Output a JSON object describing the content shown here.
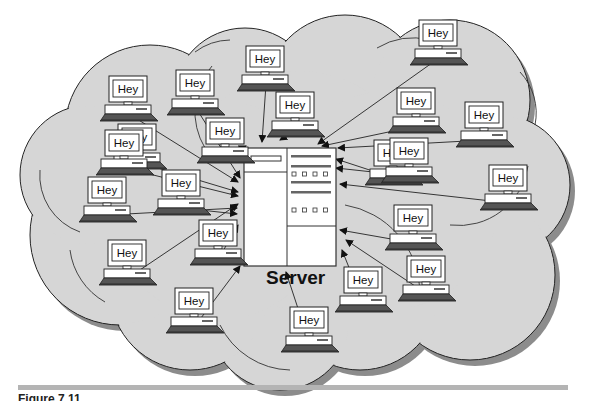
{
  "diagram": {
    "server": {
      "label": "Server"
    },
    "client_message": "Hey",
    "client_count": 22,
    "clients": [
      {
        "id": 1,
        "message": "Hey"
      },
      {
        "id": 2,
        "message": "Hey"
      },
      {
        "id": 3,
        "message": "Hey"
      },
      {
        "id": 4,
        "message": "Hey"
      },
      {
        "id": 5,
        "message": "Hey"
      },
      {
        "id": 6,
        "message": "Hey"
      },
      {
        "id": 7,
        "message": "Hey"
      },
      {
        "id": 8,
        "message": "Hey"
      },
      {
        "id": 9,
        "message": "Hey"
      },
      {
        "id": 10,
        "message": "Hey"
      },
      {
        "id": 11,
        "message": "Hey"
      },
      {
        "id": 12,
        "message": "Hey"
      },
      {
        "id": 13,
        "message": "Hey"
      },
      {
        "id": 14,
        "message": "Hey"
      },
      {
        "id": 15,
        "message": "Hey"
      },
      {
        "id": 16,
        "message": "Hey"
      },
      {
        "id": 17,
        "message": "Hey"
      },
      {
        "id": 18,
        "message": "Hey"
      },
      {
        "id": 19,
        "message": "Hey"
      },
      {
        "id": 20,
        "message": "Hey"
      },
      {
        "id": 21,
        "message": "Hey"
      },
      {
        "id": 22,
        "message": "Hey"
      }
    ],
    "caption": "Figure 7.11",
    "colors": {
      "cloud_fill": "#d6d6d6",
      "cloud_shadow": "#8c8c8c",
      "outline": "#222222",
      "server_fill": "#ffffff",
      "rule": "#b4b4b4"
    }
  }
}
